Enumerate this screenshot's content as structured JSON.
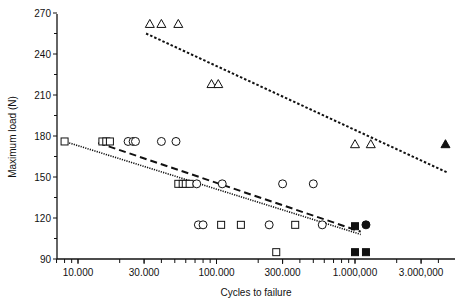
{
  "chart_data": {
    "type": "scatter",
    "title": "",
    "xlabel": "Cycles to failure",
    "ylabel": "Maximum load (N)",
    "xscale": "log",
    "xlim": [
      6500,
      5000000
    ],
    "ylim": [
      90,
      270
    ],
    "x_ticks": [
      {
        "value": 10000,
        "label": "10.000"
      },
      {
        "value": 30000,
        "label": "30.000"
      },
      {
        "value": 100000,
        "label": "100.000"
      },
      {
        "value": 300000,
        "label": "300.000"
      },
      {
        "value": 1000000,
        "label": "1.000,000"
      },
      {
        "value": 3000000,
        "label": "3.000,000"
      }
    ],
    "y_ticks": [
      {
        "value": 90,
        "label": "90"
      },
      {
        "value": 120,
        "label": "120"
      },
      {
        "value": 150,
        "label": "150"
      },
      {
        "value": 180,
        "label": "180"
      },
      {
        "value": 210,
        "label": "210"
      },
      {
        "value": 240,
        "label": "240"
      },
      {
        "value": 270,
        "label": "270"
      }
    ],
    "grid": false,
    "legend": null,
    "series": [
      {
        "name": "triangle-open",
        "marker": "triangle",
        "filled": false,
        "points": [
          [
            33000,
            262
          ],
          [
            40000,
            262
          ],
          [
            53000,
            262
          ],
          [
            92000,
            218
          ],
          [
            103000,
            218
          ],
          [
            1000000,
            174
          ],
          [
            1300000,
            174
          ]
        ]
      },
      {
        "name": "triangle-filled",
        "marker": "triangle",
        "filled": true,
        "points": [
          [
            4500000,
            174
          ]
        ]
      },
      {
        "name": "square-open",
        "marker": "square",
        "filled": false,
        "points": [
          [
            8000,
            176
          ],
          [
            15000,
            176
          ],
          [
            16000,
            176
          ],
          [
            17000,
            176
          ],
          [
            53000,
            145
          ],
          [
            57000,
            145
          ],
          [
            60000,
            145
          ],
          [
            64000,
            145
          ],
          [
            108000,
            115
          ],
          [
            150000,
            115
          ],
          [
            370000,
            115
          ],
          [
            270000,
            95
          ]
        ]
      },
      {
        "name": "square-filled",
        "marker": "square",
        "filled": true,
        "points": [
          [
            1000000,
            114
          ],
          [
            1000000,
            95
          ],
          [
            1200000,
            95
          ]
        ]
      },
      {
        "name": "circle-open",
        "marker": "circle",
        "filled": false,
        "points": [
          [
            23000,
            176
          ],
          [
            25000,
            176
          ],
          [
            26000,
            176
          ],
          [
            40000,
            176
          ],
          [
            51000,
            176
          ],
          [
            72000,
            145
          ],
          [
            110000,
            145
          ],
          [
            300000,
            145
          ],
          [
            500000,
            145
          ],
          [
            74000,
            115
          ],
          [
            80000,
            115
          ],
          [
            240000,
            115
          ],
          [
            580000,
            115
          ]
        ]
      },
      {
        "name": "circle-filled",
        "marker": "circle",
        "filled": true,
        "points": [
          [
            1200000,
            115
          ]
        ]
      }
    ],
    "trend_lines": [
      {
        "name": "triangle-trend",
        "style": "dotted-coarse",
        "from": [
          31000,
          255
        ],
        "to": [
          4700000,
          153
        ]
      },
      {
        "name": "circle-trend",
        "style": "dashed",
        "from": [
          14000,
          175
        ],
        "to": [
          1100000,
          110
        ]
      },
      {
        "name": "square-trend",
        "style": "dotted-fine",
        "from": [
          8000,
          176
        ],
        "to": [
          1100000,
          108
        ]
      }
    ]
  }
}
